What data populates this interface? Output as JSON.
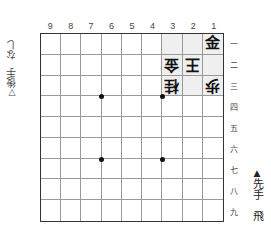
{
  "diagram": {
    "file_labels": [
      "9",
      "8",
      "7",
      "6",
      "5",
      "4",
      "3",
      "2",
      "1"
    ],
    "rank_labels": [
      "一",
      "二",
      "三",
      "四",
      "五",
      "六",
      "七",
      "八",
      "九"
    ],
    "highlight_color": "#efefef",
    "pieces": [
      {
        "file": 1,
        "rank": 1,
        "kanji": "金",
        "side": "sente",
        "name": "gold"
      },
      {
        "file": 3,
        "rank": 2,
        "kanji": "金",
        "side": "gote",
        "name": "gold"
      },
      {
        "file": 2,
        "rank": 2,
        "kanji": "王",
        "side": "gote",
        "name": "king"
      },
      {
        "file": 3,
        "rank": 3,
        "kanji": "桂",
        "side": "gote",
        "name": "knight"
      },
      {
        "file": 1,
        "rank": 3,
        "kanji": "歩",
        "side": "gote",
        "name": "pawn"
      }
    ],
    "highlighted_squares": [
      {
        "file": 1,
        "rank": 1
      },
      {
        "file": 1,
        "rank": 2
      },
      {
        "file": 1,
        "rank": 3
      },
      {
        "file": 2,
        "rank": 1
      },
      {
        "file": 2,
        "rank": 2
      },
      {
        "file": 2,
        "rank": 3
      },
      {
        "file": 3,
        "rank": 1
      },
      {
        "file": 3,
        "rank": 2
      },
      {
        "file": 3,
        "rank": 3
      }
    ],
    "star_points": [
      {
        "after_file": 7,
        "after_rank": 3
      },
      {
        "after_file": 4,
        "after_rank": 3
      },
      {
        "after_file": 7,
        "after_rank": 6
      },
      {
        "after_file": 4,
        "after_rank": 6
      }
    ]
  },
  "gote_hand": {
    "mark": "▽",
    "label": "後手",
    "pieces": "なし"
  },
  "sente_hand": {
    "mark": "▲",
    "label": "先手",
    "pieces": "飛"
  }
}
